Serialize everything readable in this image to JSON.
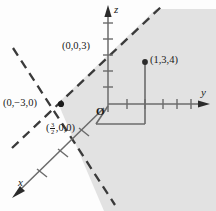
{
  "figure": {
    "width": 216,
    "height": 211,
    "background_color": "#fdfdfd",
    "shade_color": "#e2e2e2",
    "line_color": "#6b6b6b",
    "dash_color": "#3a3a3a",
    "text_color": "#1a1a1a"
  },
  "axes": {
    "z": {
      "label": "z",
      "direction": "up",
      "tick_count": 6
    },
    "y": {
      "label": "y",
      "direction": "right",
      "tick_count": 5
    },
    "x": {
      "label": "x",
      "direction": "down-left",
      "tick_count": 3
    }
  },
  "origin": {
    "label": "O"
  },
  "intercepts": [
    {
      "name": "z-intercept",
      "label": "(0,0,3)"
    },
    {
      "name": "y-intercept",
      "label": "(0,−3,0)"
    },
    {
      "name": "x-intercept",
      "label_prefix": "(",
      "label_numerator": "3",
      "label_denominator": "2",
      "label_suffix": ",0,0)"
    }
  ],
  "point": {
    "label": "(1,3,4)",
    "coords": [
      1,
      3,
      4
    ]
  },
  "region": {
    "name": "shaded-half-space",
    "style": "solid gray fill bounded by dashed plane traces"
  }
}
